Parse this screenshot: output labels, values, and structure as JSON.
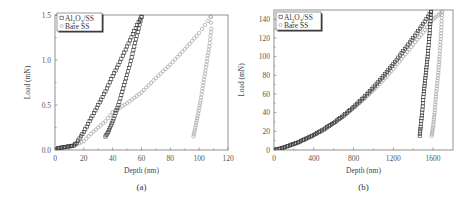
{
  "chart_data": [
    {
      "type": "scatter",
      "panel": "(a)",
      "title": "",
      "xlabel": "Depth (nm)",
      "ylabel": "Load (mN)",
      "xlim": [
        0,
        120
      ],
      "ylim": [
        0,
        1.5
      ],
      "xticks": [
        0,
        20,
        40,
        60,
        80,
        100,
        120
      ],
      "yticks": [
        0.0,
        0.5,
        1.0,
        1.5
      ],
      "ytick_labels": [
        "0.0",
        "0.5",
        "1.0",
        "1.5"
      ],
      "grid": false,
      "legend_position": "upper left",
      "series": [
        {
          "name": "Al2O3/SS",
          "marker": "square",
          "color": "#333333",
          "loading": {
            "x": [
              0,
              2,
              13,
              15,
              20,
              25,
              30,
              35,
              40,
              45,
              50,
              55,
              58,
              60
            ],
            "y": [
              0.0,
              0.02,
              0.05,
              0.08,
              0.2,
              0.35,
              0.5,
              0.65,
              0.82,
              0.98,
              1.15,
              1.32,
              1.42,
              1.48
            ]
          },
          "unloading": {
            "x": [
              60,
              58,
              55,
              52,
              48,
              44,
              40,
              37,
              35
            ],
            "y": [
              1.48,
              1.35,
              1.15,
              0.95,
              0.72,
              0.5,
              0.32,
              0.2,
              0.15
            ]
          }
        },
        {
          "name": "Bare SS",
          "marker": "circle",
          "color": "#999999",
          "loading": {
            "x": [
              0,
              10,
              15,
              20,
              25,
              30,
              35,
              40,
              50,
              60,
              70,
              80,
              90,
              100,
              108
            ],
            "y": [
              0.0,
              0.03,
              0.06,
              0.1,
              0.18,
              0.25,
              0.32,
              0.42,
              0.52,
              0.64,
              0.8,
              0.95,
              1.12,
              1.3,
              1.48
            ]
          },
          "unloading": {
            "x": [
              108,
              108.5,
              107,
              105,
              103,
              101,
              99,
              97,
              96
            ],
            "y": [
              1.48,
              1.35,
              1.15,
              0.95,
              0.75,
              0.55,
              0.38,
              0.22,
              0.15
            ]
          }
        }
      ]
    },
    {
      "type": "scatter",
      "panel": "(b)",
      "title": "",
      "xlabel": "Depth (nm)",
      "ylabel": "Load (mN)",
      "xlim": [
        0,
        1800
      ],
      "ylim": [
        0,
        150
      ],
      "xticks": [
        0,
        400,
        800,
        1200,
        1600
      ],
      "yticks": [
        0,
        20,
        40,
        60,
        80,
        100,
        120,
        140
      ],
      "grid": false,
      "legend_position": "upper left",
      "series": [
        {
          "name": "Al2O3/SS",
          "marker": "square",
          "color": "#333333",
          "loading": {
            "x": [
              0,
              80,
              160,
              240,
              320,
              400,
              500,
              600,
              700,
              800,
              900,
              1000,
              1100,
              1200,
              1300,
              1400,
              1500,
              1580
            ],
            "y": [
              0,
              2,
              5,
              8,
              12,
              16,
              22,
              29,
              37,
              46,
              56,
              67,
              79,
              92,
              106,
              120,
              135,
              148
            ]
          },
          "unloading": {
            "x": [
              1580,
              1565,
              1545,
              1525,
              1505,
              1490,
              1475,
              1465
            ],
            "y": [
              148,
              125,
              100,
              80,
              60,
              40,
              25,
              15
            ]
          }
        },
        {
          "name": "Bare SS",
          "marker": "circle",
          "color": "#999999",
          "loading": {
            "x": [
              0,
              80,
              160,
              240,
              320,
              400,
              500,
              600,
              700,
              800,
              900,
              1000,
              1100,
              1200,
              1300,
              1400,
              1500,
              1600,
              1690
            ],
            "y": [
              0,
              2,
              5,
              8,
              12,
              16,
              22,
              29,
              36,
              45,
              54,
              64,
              75,
              87,
              100,
              113,
              126,
              140,
              148
            ]
          },
          "unloading": {
            "x": [
              1690,
              1680,
              1665,
              1650,
              1630,
              1615,
              1600,
              1585
            ],
            "y": [
              148,
              125,
              100,
              80,
              60,
              40,
              25,
              15
            ]
          }
        }
      ]
    }
  ],
  "panels": {
    "a": {
      "label": "(a)",
      "xlabel": "Depth (nm)",
      "ylabel": "Load (mN)",
      "legend": [
        "Al2O3/SS",
        "Bare SS"
      ]
    },
    "b": {
      "label": "(b)",
      "xlabel": "Depth (nm)",
      "ylabel": "Load (mN)",
      "legend": [
        "Al2O3/SS",
        "Bare SS"
      ]
    }
  }
}
